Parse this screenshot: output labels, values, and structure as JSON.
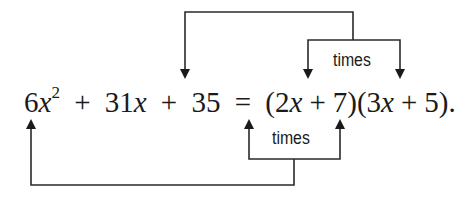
{
  "equation": {
    "lhs": {
      "term1_coef": "6",
      "term1_var": "x",
      "term1_exp": "2",
      "op1": "+",
      "term2_coef": "31",
      "term2_var": "x",
      "op2": "+",
      "term3": "35"
    },
    "equals": "=",
    "rhs": {
      "factor1_open": "(",
      "factor1_coef": "2",
      "factor1_var": "x",
      "factor1_op": "+",
      "factor1_const": "7",
      "factor1_close": ")",
      "factor2_open": "(",
      "factor2_coef": "3",
      "factor2_var": "x",
      "factor2_op": "+",
      "factor2_const": "5",
      "factor2_close": ")",
      "terminator": "."
    }
  },
  "annotations": {
    "top_label": "times",
    "bottom_label": "times"
  },
  "connectors": {
    "top_inner": "7 times 5 -> 35",
    "bottom_inner": "2x times 3x -> 6x^2"
  },
  "colors": {
    "ink": "#1a1a1a",
    "background": "#ffffff"
  }
}
